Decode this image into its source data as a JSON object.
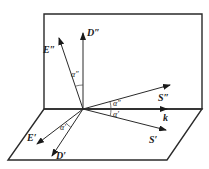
{
  "diagram": {
    "type": "vector geometry",
    "colors": {
      "line": "#2a2a2a",
      "background": "#ffffff"
    },
    "planes": [
      {
        "name": "vertical-plane",
        "points": [
          [
            44,
            14
          ],
          [
            202,
            14
          ],
          [
            202,
            109
          ],
          [
            44,
            109
          ]
        ]
      },
      {
        "name": "horizontal-plane",
        "points": [
          [
            44,
            109
          ],
          [
            202,
            109
          ],
          [
            167,
            160
          ],
          [
            8,
            160
          ]
        ]
      }
    ],
    "origin": [
      83,
      109
    ],
    "vectors": [
      {
        "id": "D2",
        "label": "D″",
        "to": [
          83,
          33
        ],
        "label_pos": [
          87,
          36
        ]
      },
      {
        "id": "E2",
        "label": "E″",
        "to": [
          59,
          38
        ],
        "label_pos": [
          43,
          53
        ]
      },
      {
        "id": "S2",
        "label": "S″",
        "to": [
          170,
          85
        ],
        "label_pos": [
          158,
          101
        ]
      },
      {
        "id": "k",
        "label": "k",
        "to": [
          167,
          109
        ],
        "label_pos": [
          163,
          121
        ]
      },
      {
        "id": "S1",
        "label": "S′",
        "to": [
          166,
          130
        ],
        "label_pos": [
          149,
          143
        ]
      },
      {
        "id": "E1",
        "label": "E′",
        "to": [
          37,
          144
        ],
        "label_pos": [
          27,
          141
        ]
      },
      {
        "id": "D1",
        "label": "D′",
        "to": [
          52,
          156
        ],
        "label_pos": [
          56,
          159
        ]
      }
    ],
    "angles": [
      {
        "label": "α″",
        "between": [
          "D2",
          "E2"
        ],
        "label_pos": [
          71,
          77
        ]
      },
      {
        "label": "α″",
        "between": [
          "k",
          "S2"
        ],
        "label_pos": [
          113,
          106
        ]
      },
      {
        "label": "α′",
        "between": [
          "k",
          "S1"
        ],
        "label_pos": [
          113,
          117
        ]
      },
      {
        "label": "α′",
        "between": [
          "E1",
          "D1"
        ],
        "label_pos": [
          60,
          130
        ]
      }
    ]
  }
}
